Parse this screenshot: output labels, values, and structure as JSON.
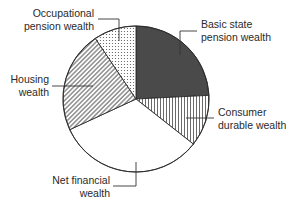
{
  "chart_data": {
    "type": "pie",
    "title": "",
    "start_angle_deg": 0,
    "direction": "clockwise",
    "center": [
      136,
      99
    ],
    "radius": 73,
    "slices": [
      {
        "name": "Basic state pension wealth",
        "value": 24.2,
        "fill": "dark-solid",
        "color": "#4a4a4a",
        "label_lines": [
          "Basic state",
          "pension wealth"
        ],
        "label_pos": [
          201,
          28
        ],
        "anchor": "start",
        "leader": [
          [
            180,
            55
          ],
          [
            180,
            31
          ],
          [
            197,
            31
          ]
        ]
      },
      {
        "name": "Consumer durable wealth",
        "value": 11.4,
        "fill": "vertical-stripes",
        "color": "#ffffff",
        "label_lines": [
          "Consumer",
          "durable wealth"
        ],
        "label_pos": [
          218,
          116
        ],
        "anchor": "start",
        "leader": [
          [
            186,
            118
          ],
          [
            214,
            118
          ]
        ]
      },
      {
        "name": "Net financial wealth",
        "value": 32.5,
        "fill": "white",
        "color": "#ffffff",
        "label_lines": [
          "Net financial",
          "wealth"
        ],
        "label_pos": [
          110,
          184
        ],
        "anchor": "end",
        "leader": [
          [
            136,
            162
          ],
          [
            136,
            186
          ],
          [
            113,
            186
          ]
        ]
      },
      {
        "name": "Housing wealth",
        "value": 22.5,
        "fill": "diagonal-stripes",
        "color": "#ffffff",
        "label_lines": [
          "Housing",
          "wealth"
        ],
        "label_pos": [
          49,
          83
        ],
        "anchor": "end",
        "leader": [
          [
            52,
            86
          ],
          [
            93,
            86
          ]
        ]
      },
      {
        "name": "Occupational pension wealth",
        "value": 9.4,
        "fill": "dots",
        "color": "#ffffff",
        "label_lines": [
          "Occupational",
          "pension wealth"
        ],
        "label_pos": [
          94,
          17
        ],
        "anchor": "end",
        "leader": [
          [
            98,
            19
          ],
          [
            119,
            19
          ],
          [
            119,
            41
          ]
        ]
      }
    ],
    "legend": "none (direct labels with leader lines)",
    "xlabel": "",
    "ylabel": ""
  }
}
